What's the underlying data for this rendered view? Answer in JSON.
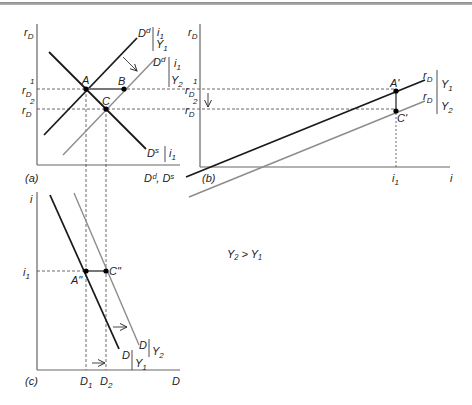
{
  "figure": {
    "condition_label": "Y₂ > Y₁",
    "colors": {
      "black_curve": "#1a1a1a",
      "gray_curve": "#8c8c8c",
      "axis": "#555555",
      "dashed": "#444444"
    }
  },
  "panel_a": {
    "tag": "(a)",
    "y_axis_label": "r",
    "y_axis_sub": "D",
    "x_axis_label": "Dᵈ, Dˢ",
    "ticks": {
      "r1": "r",
      "r1_sub": "D",
      "r1_sup": "1",
      "r2": "r",
      "r2_sub": "D",
      "r2_sup": "2"
    },
    "curves": {
      "demand_y1": {
        "name": "D",
        "sup": "d",
        "cond_top": "i",
        "cond_top_sub": "1",
        "cond_bot": "Y",
        "cond_bot_sub": "1"
      },
      "demand_y2": {
        "name": "D",
        "sup": "d",
        "cond_top": "i",
        "cond_top_sub": "1",
        "cond_bot": "Y",
        "cond_bot_sub": "2"
      },
      "supply": {
        "name": "D",
        "sup": "s",
        "cond": "i",
        "cond_sub": "1"
      }
    },
    "points": {
      "A": "A",
      "B": "B",
      "C": "C"
    }
  },
  "panel_b": {
    "tag": "(b)",
    "y_axis_label": "r",
    "y_axis_sub": "D",
    "x_axis_label": "i",
    "x_tick": "i",
    "x_tick_sub": "1",
    "ticks": {
      "r1": "r",
      "r1_sub": "D",
      "r1_sup": "1",
      "r2": "r",
      "r2_sub": "D",
      "r2_sup": "2"
    },
    "curves": {
      "rd_y1": {
        "name": "r",
        "sub": "D",
        "cond": "Y",
        "cond_sub": "1"
      },
      "rd_y2": {
        "name": "r",
        "sub": "D",
        "cond": "Y",
        "cond_sub": "2"
      }
    },
    "points": {
      "A_prime": "A'",
      "C_prime": "C'"
    }
  },
  "panel_c": {
    "tag": "(c)",
    "y_axis_label": "i",
    "x_axis_label": "D",
    "y_tick": "i",
    "y_tick_sub": "1",
    "x_ticks": [
      {
        "label": "D",
        "sub": "1"
      },
      {
        "label": "D",
        "sub": "2"
      }
    ],
    "curves": {
      "d_y1": {
        "name": "D",
        "cond": "Y",
        "cond_sub": "1"
      },
      "d_y2": {
        "name": "D",
        "cond": "Y",
        "cond_sub": "2"
      }
    },
    "points": {
      "A_dprime": "A\"",
      "C_dprime": "C\""
    }
  }
}
